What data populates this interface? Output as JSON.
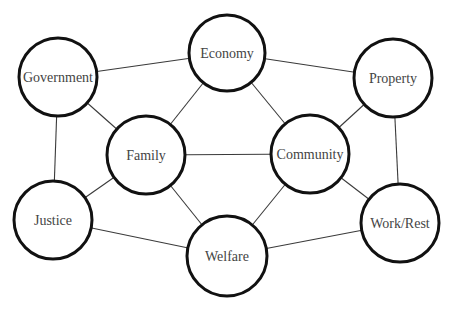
{
  "diagram": {
    "type": "network",
    "colors": {
      "node_stroke": "#111111",
      "node_fill": "#ffffff",
      "edge": "#3a3a3a",
      "label": "#444444"
    },
    "nodes": [
      {
        "id": "economy",
        "label": "Economy",
        "cx": 227,
        "cy": 53,
        "r": 38
      },
      {
        "id": "government",
        "label": "Government",
        "cx": 58,
        "cy": 77,
        "r": 39
      },
      {
        "id": "property",
        "label": "Property",
        "cx": 393,
        "cy": 78,
        "r": 39
      },
      {
        "id": "family",
        "label": "Family",
        "cx": 146,
        "cy": 155,
        "r": 39
      },
      {
        "id": "community",
        "label": "Community",
        "cx": 310,
        "cy": 154,
        "r": 39
      },
      {
        "id": "justice",
        "label": "Justice",
        "cx": 53,
        "cy": 220,
        "r": 39
      },
      {
        "id": "welfare",
        "label": "Welfare",
        "cx": 227,
        "cy": 256,
        "r": 40
      },
      {
        "id": "workrest",
        "label": "Work/Rest",
        "cx": 400,
        "cy": 223,
        "r": 39
      }
    ],
    "edges": [
      [
        "government",
        "economy"
      ],
      [
        "economy",
        "property"
      ],
      [
        "government",
        "family"
      ],
      [
        "government",
        "justice"
      ],
      [
        "economy",
        "family"
      ],
      [
        "economy",
        "community"
      ],
      [
        "property",
        "community"
      ],
      [
        "property",
        "workrest"
      ],
      [
        "family",
        "community"
      ],
      [
        "family",
        "justice"
      ],
      [
        "family",
        "welfare"
      ],
      [
        "community",
        "welfare"
      ],
      [
        "community",
        "workrest"
      ],
      [
        "justice",
        "welfare"
      ],
      [
        "welfare",
        "workrest"
      ]
    ]
  }
}
